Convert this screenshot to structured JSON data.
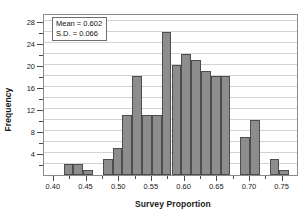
{
  "chart_data": {
    "type": "bar",
    "title": "",
    "xlabel": "Survey Proportion",
    "ylabel": "Frequency",
    "grid": true,
    "legend": "none",
    "xlim": [
      0.385,
      0.775
    ],
    "ylim": [
      0,
      29.5
    ],
    "x_tick_labels": [
      "0.40",
      "0.45",
      "0.50",
      "0.55",
      "0.60",
      "0.65",
      "0.70",
      "0.75"
    ],
    "x_tick_values": [
      0.4,
      0.45,
      0.5,
      0.55,
      0.6,
      0.65,
      0.7,
      0.75
    ],
    "y_tick_labels": [
      "4",
      "8",
      "12",
      "16",
      "20",
      "24",
      "28"
    ],
    "y_tick_values": [
      4,
      8,
      12,
      16,
      20,
      24,
      28
    ],
    "y_minor_tick_values": [
      2,
      6,
      10,
      14,
      18,
      22,
      26
    ],
    "gridline_values": [
      2,
      4,
      6,
      8,
      10,
      12,
      14,
      16,
      18,
      20,
      22,
      24,
      26,
      28
    ],
    "bin_width": 0.015,
    "bin_starts": [
      0.415,
      0.43,
      0.445,
      0.46,
      0.475,
      0.49,
      0.505,
      0.52,
      0.535,
      0.55,
      0.565,
      0.58,
      0.595,
      0.61,
      0.625,
      0.64,
      0.655,
      0.67,
      0.685,
      0.7,
      0.715,
      0.73,
      0.745,
      0.76
    ],
    "values": [
      2,
      2,
      1,
      0,
      3,
      5,
      11,
      18,
      11,
      0,
      26,
      20,
      22,
      21,
      19,
      18,
      0,
      7,
      10,
      3,
      1
    ],
    "bars": [
      {
        "start": 0.415,
        "count": 2
      },
      {
        "start": 0.43,
        "count": 2
      },
      {
        "start": 0.445,
        "count": 1
      },
      {
        "start": 0.475,
        "count": 3
      },
      {
        "start": 0.49,
        "count": 5
      },
      {
        "start": 0.505,
        "count": 11
      },
      {
        "start": 0.52,
        "count": 18
      },
      {
        "start": 0.535,
        "count": 11
      },
      {
        "start": 0.55,
        "count": 11
      },
      {
        "start": 0.565,
        "count": 26
      },
      {
        "start": 0.58,
        "count": 20
      },
      {
        "start": 0.595,
        "count": 22
      },
      {
        "start": 0.61,
        "count": 21
      },
      {
        "start": 0.625,
        "count": 19
      },
      {
        "start": 0.64,
        "count": 18
      },
      {
        "start": 0.655,
        "count": 18
      },
      {
        "start": 0.685,
        "count": 7
      },
      {
        "start": 0.7,
        "count": 10
      },
      {
        "start": 0.73,
        "count": 3
      },
      {
        "start": 0.745,
        "count": 1
      }
    ],
    "bar_fill_color": "#8d8d8d",
    "bar_edge_color": "#4d4d4d",
    "gridline_color": "#d2d2d2",
    "axis_color": "#8c8c8c"
  },
  "annotation": {
    "mean_label": "Mean = 0.602",
    "sd_label": "S.D. = 0.066"
  }
}
